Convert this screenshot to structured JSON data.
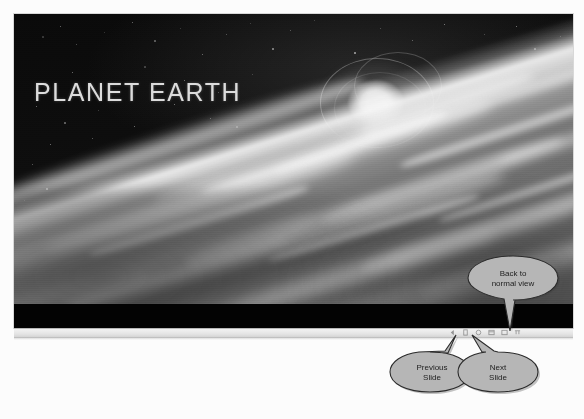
{
  "application": "Microsoft PowerPoint — Slide Show view",
  "slide": {
    "title": "PLANET EARTH",
    "background_description": "Photograph of Earth's horizon from orbit with the Sun and lens flare",
    "title_color": "#dcdcdc",
    "background_color": "#050505"
  },
  "control_bar": {
    "name": "slide-show-popup-toolbar",
    "icons": [
      {
        "name": "previous-slide-icon",
        "glyph": "◄",
        "label": "Previous Slide"
      },
      {
        "name": "pen-pointer-icon",
        "glyph": "✎",
        "label": "Pointer Options"
      },
      {
        "name": "next-slide-icon",
        "glyph": "►",
        "label": "Next Slide"
      },
      {
        "name": "menu-options-icon",
        "glyph": "▣",
        "label": "Slide Show Menu"
      },
      {
        "name": "zoom-icon",
        "glyph": "◉",
        "label": "Zoom"
      },
      {
        "name": "end-show-icon",
        "glyph": "▭",
        "label": "End Show"
      }
    ]
  },
  "callouts": [
    {
      "id": "back-to-normal-view",
      "name": "callout-back-to-normal-view",
      "lines": [
        "Back to",
        "normal view"
      ],
      "points_to": "menu-options-icon",
      "fill": "#b6b6b6",
      "stroke": "#2b2b2b"
    },
    {
      "id": "previous-slide",
      "name": "callout-previous-slide",
      "lines": [
        "Previous",
        "Slide"
      ],
      "points_to": "previous-slide-icon",
      "fill": "#b6b6b6",
      "stroke": "#2b2b2b"
    },
    {
      "id": "next-slide",
      "name": "callout-next-slide",
      "lines": [
        "Next",
        "Slide"
      ],
      "points_to": "next-slide-icon",
      "fill": "#b6b6b6",
      "stroke": "#2b2b2b"
    }
  ]
}
